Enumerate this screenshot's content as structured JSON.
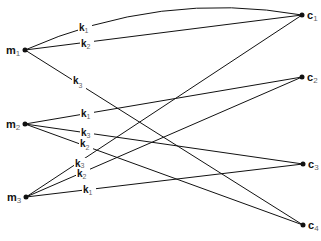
{
  "diagram": {
    "type": "bipartite-graph",
    "left_nodes": [
      {
        "id": "m1",
        "label": "m",
        "sub": "1",
        "x": 25,
        "y": 50
      },
      {
        "id": "m2",
        "label": "m",
        "sub": "2",
        "x": 25,
        "y": 124
      },
      {
        "id": "m3",
        "label": "m",
        "sub": "3",
        "x": 26,
        "y": 197
      }
    ],
    "right_nodes": [
      {
        "id": "c1",
        "label": "c",
        "sub": "1",
        "x": 302,
        "y": 15
      },
      {
        "id": "c2",
        "label": "c",
        "sub": "2",
        "x": 302,
        "y": 77
      },
      {
        "id": "c3",
        "label": "c",
        "sub": "3",
        "x": 303,
        "y": 164
      },
      {
        "id": "c4",
        "label": "c",
        "sub": "4",
        "x": 303,
        "y": 225
      }
    ],
    "edges": [
      {
        "from": "m1",
        "to": "c1",
        "label": "k",
        "sub": "1",
        "curved": true
      },
      {
        "from": "m1",
        "to": "c1",
        "label": "k",
        "sub": "2"
      },
      {
        "from": "m1",
        "to": "c4",
        "label": "k",
        "sub": "3"
      },
      {
        "from": "m2",
        "to": "c2",
        "label": "k",
        "sub": "1"
      },
      {
        "from": "m2",
        "to": "c3",
        "label": "k",
        "sub": "3"
      },
      {
        "from": "m2",
        "to": "c4",
        "label": "k",
        "sub": "2"
      },
      {
        "from": "m3",
        "to": "c1",
        "label": "k",
        "sub": "3"
      },
      {
        "from": "m3",
        "to": "c2",
        "label": "k",
        "sub": "2"
      },
      {
        "from": "m3",
        "to": "c3",
        "label": "k",
        "sub": "1"
      }
    ],
    "colors": {
      "line": "#111111",
      "background": "#ffffff",
      "subscript": "#666666"
    }
  }
}
